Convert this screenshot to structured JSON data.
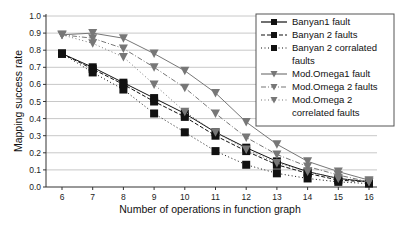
{
  "chart_data": {
    "type": "line",
    "title": "",
    "xlabel": "Number of operations in function graph",
    "ylabel": "Mapping success rate",
    "x": [
      6,
      7,
      8,
      9,
      10,
      11,
      12,
      13,
      14,
      15,
      16
    ],
    "xlim": [
      6,
      16
    ],
    "ylim": [
      0.0,
      1.0
    ],
    "yticks": [
      "0.0",
      "0.1",
      "0.2",
      "0.3",
      "0.4",
      "0.5",
      "0.6",
      "0.7",
      "0.8",
      "0.9",
      "1.0"
    ],
    "xticks": [
      "6",
      "7",
      "8",
      "9",
      "10",
      "11",
      "12",
      "13",
      "14",
      "15",
      "16"
    ],
    "grid": "horizontal",
    "legend_position": "upper right",
    "series": [
      {
        "name": "Banyan1 fault",
        "marker": "square",
        "line": "solid",
        "color": "#111111",
        "values": [
          0.78,
          0.7,
          0.61,
          0.52,
          0.43,
          0.32,
          0.23,
          0.15,
          0.09,
          0.05,
          0.03
        ]
      },
      {
        "name": "Banyan 2 faults",
        "marker": "square",
        "line": "dashed",
        "color": "#111111",
        "values": [
          0.78,
          0.69,
          0.6,
          0.5,
          0.41,
          0.3,
          0.21,
          0.13,
          0.08,
          0.04,
          0.03
        ]
      },
      {
        "name": "Banyan 2 corralated faults",
        "marker": "square",
        "line": "dotted",
        "color": "#111111",
        "values": [
          0.78,
          0.67,
          0.57,
          0.43,
          0.32,
          0.21,
          0.13,
          0.08,
          0.05,
          0.03,
          0.02
        ]
      },
      {
        "name": "Mod.Omega1 fault",
        "marker": "triangle-down",
        "line": "solid",
        "color": "#777777",
        "values": [
          0.89,
          0.9,
          0.87,
          0.78,
          0.68,
          0.55,
          0.38,
          0.25,
          0.15,
          0.09,
          0.04
        ]
      },
      {
        "name": "Mod.Omega 2 faults",
        "marker": "triangle-down",
        "line": "dashdot",
        "color": "#777777",
        "values": [
          0.89,
          0.87,
          0.81,
          0.7,
          0.58,
          0.43,
          0.29,
          0.19,
          0.12,
          0.07,
          0.03
        ]
      },
      {
        "name": "Mod.Omega 2 correlated faults",
        "marker": "triangle-down",
        "line": "dotted",
        "color": "#777777",
        "values": [
          0.89,
          0.84,
          0.76,
          0.6,
          0.44,
          0.32,
          0.22,
          0.14,
          0.09,
          0.05,
          0.03
        ]
      }
    ]
  },
  "legend": {
    "entries": [
      {
        "lines": [
          "Banyan1 fault"
        ]
      },
      {
        "lines": [
          "Banyan 2 faults"
        ]
      },
      {
        "lines": [
          "Banyan 2 corralated",
          "faults"
        ]
      },
      {
        "lines": [
          "Mod.Omega1 fault"
        ]
      },
      {
        "lines": [
          "Mod.Omega 2 faults"
        ]
      },
      {
        "lines": [
          "Mod.Omega 2",
          "correlated faults"
        ]
      }
    ]
  }
}
